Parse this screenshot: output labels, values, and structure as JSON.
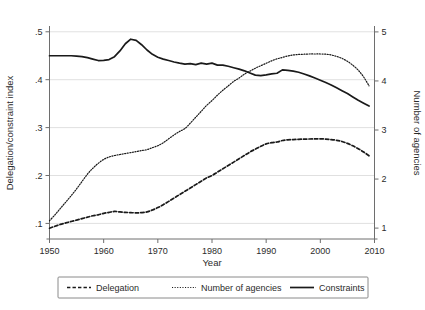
{
  "chart_data": {
    "type": "line",
    "title": "",
    "xlabel": "Year",
    "ylabel": "Delegation/constraint index",
    "y2label": "Number of agencies",
    "xlim": [
      1950,
      2010
    ],
    "ylim": [
      0.08,
      0.51
    ],
    "y2lim": [
      0.9,
      5.1
    ],
    "grid": true,
    "legend_position": "bottom",
    "xticks": [
      "1950",
      "1960",
      "1970",
      "1980",
      "1990",
      "2000",
      "2010"
    ],
    "xtick_values": [
      1950,
      1960,
      1970,
      1980,
      1990,
      2000,
      2010
    ],
    "yticks": [
      ".1",
      ".2",
      ".3",
      ".4",
      ".5"
    ],
    "ytick_values": [
      0.1,
      0.2,
      0.3,
      0.4,
      0.5
    ],
    "y2ticks": [
      "1",
      "2",
      "3",
      "4",
      "5"
    ],
    "y2tick_values": [
      1,
      2,
      3,
      4,
      5
    ],
    "x": [
      1950,
      1951,
      1952,
      1953,
      1954,
      1955,
      1956,
      1957,
      1958,
      1959,
      1960,
      1961,
      1962,
      1963,
      1964,
      1965,
      1966,
      1967,
      1968,
      1969,
      1970,
      1971,
      1972,
      1973,
      1974,
      1975,
      1976,
      1977,
      1978,
      1979,
      1980,
      1981,
      1982,
      1983,
      1984,
      1985,
      1986,
      1987,
      1988,
      1989,
      1990,
      1991,
      1992,
      1993,
      1994,
      1995,
      1996,
      1997,
      1998,
      1999,
      2000,
      2001,
      2002,
      2003,
      2004,
      2005,
      2006,
      2007,
      2008,
      2009
    ],
    "series": [
      {
        "name": "Delegation",
        "axis": "left",
        "style": "dashed",
        "values": [
          0.09,
          0.094,
          0.098,
          0.101,
          0.104,
          0.107,
          0.11,
          0.113,
          0.116,
          0.118,
          0.121,
          0.123,
          0.125,
          0.124,
          0.123,
          0.1225,
          0.122,
          0.1225,
          0.124,
          0.128,
          0.133,
          0.139,
          0.146,
          0.153,
          0.16,
          0.167,
          0.174,
          0.181,
          0.188,
          0.195,
          0.2,
          0.207,
          0.214,
          0.221,
          0.228,
          0.235,
          0.242,
          0.249,
          0.255,
          0.261,
          0.266,
          0.2685,
          0.27,
          0.273,
          0.2745,
          0.275,
          0.2755,
          0.276,
          0.2762,
          0.2765,
          0.2765,
          0.276,
          0.275,
          0.2735,
          0.271,
          0.267,
          0.262,
          0.256,
          0.249,
          0.241
        ]
      },
      {
        "name": "Number of agencies",
        "axis": "right",
        "style": "dotted",
        "values": [
          1.15,
          1.27,
          1.4,
          1.53,
          1.66,
          1.8,
          1.95,
          2.1,
          2.22,
          2.32,
          2.4,
          2.45,
          2.48,
          2.5,
          2.52,
          2.54,
          2.56,
          2.58,
          2.6,
          2.64,
          2.68,
          2.74,
          2.82,
          2.9,
          2.97,
          3.03,
          3.14,
          3.26,
          3.38,
          3.5,
          3.6,
          3.71,
          3.81,
          3.9,
          3.99,
          4.06,
          4.14,
          4.2,
          4.26,
          4.31,
          4.36,
          4.41,
          4.45,
          4.48,
          4.51,
          4.53,
          4.54,
          4.545,
          4.55,
          4.55,
          4.55,
          4.545,
          4.53,
          4.5,
          4.46,
          4.4,
          4.32,
          4.22,
          4.08,
          3.9
        ]
      },
      {
        "name": "Constraints",
        "axis": "left",
        "style": "solid",
        "values": [
          0.45,
          0.45,
          0.45,
          0.45,
          0.45,
          0.449,
          0.448,
          0.446,
          0.443,
          0.44,
          0.4405,
          0.442,
          0.448,
          0.46,
          0.475,
          0.4845,
          0.482,
          0.473,
          0.462,
          0.453,
          0.447,
          0.443,
          0.44,
          0.437,
          0.4345,
          0.4325,
          0.4335,
          0.4315,
          0.4345,
          0.4325,
          0.4345,
          0.4305,
          0.4305,
          0.428,
          0.425,
          0.422,
          0.4185,
          0.414,
          0.4095,
          0.4085,
          0.41,
          0.412,
          0.4135,
          0.4205,
          0.4195,
          0.418,
          0.4155,
          0.412,
          0.408,
          0.4035,
          0.399,
          0.394,
          0.389,
          0.383,
          0.377,
          0.371,
          0.364,
          0.357,
          0.351,
          0.345
        ]
      }
    ]
  },
  "legend": {
    "items": [
      {
        "label": "Delegation",
        "style": "dashed"
      },
      {
        "label": "Number of agencies",
        "style": "dotted"
      },
      {
        "label": "Constraints",
        "style": "solid"
      }
    ]
  },
  "colors": {
    "line": "#1a1a1a",
    "grid": "#d8d8d8",
    "spine": "#6e6e6e",
    "text": "#2b2b2b",
    "background": "#ffffff"
  }
}
